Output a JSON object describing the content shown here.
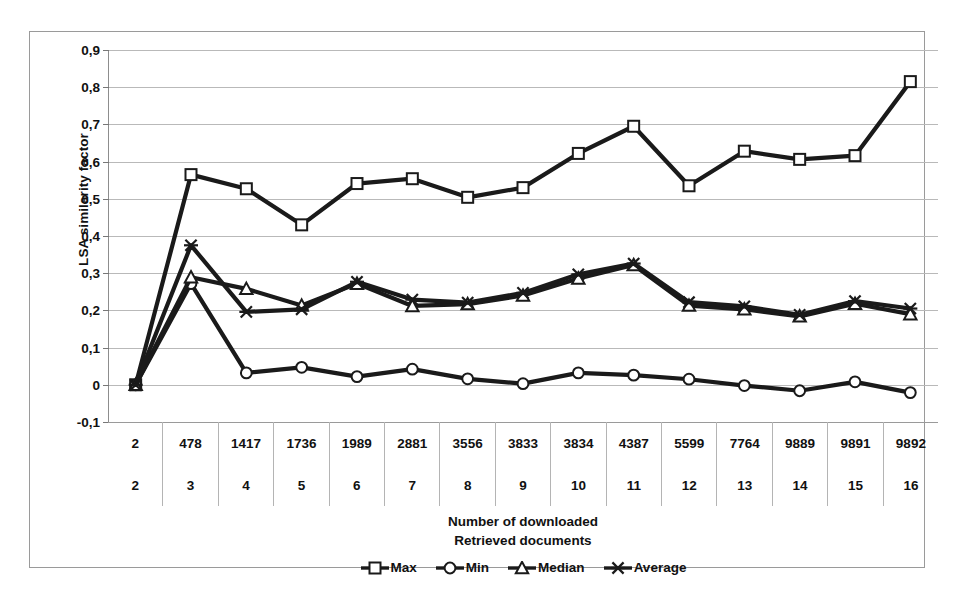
{
  "chart_data": {
    "type": "line",
    "title": "",
    "xlabel": "Number of downloaded\nRetrieved documents",
    "ylabel": "LSA similarity factor",
    "ylim": [
      -0.1,
      0.9
    ],
    "ytick_labels": [
      "0,9",
      "0,8",
      "0,7",
      "0,6",
      "0,5",
      "0,4",
      "0,3",
      "0,2",
      "0,1",
      "0",
      "-0,1"
    ],
    "ytick_values": [
      0.9,
      0.8,
      0.7,
      0.6,
      0.5,
      0.4,
      0.3,
      0.2,
      0.1,
      0,
      -0.1
    ],
    "grid": true,
    "legend_position": "bottom",
    "x_axis_table": {
      "row_top_label": "Number of downloaded",
      "row_bottom_label": "Retrieved documents",
      "row_top": [
        "2",
        "478",
        "1417",
        "1736",
        "1989",
        "2881",
        "3556",
        "3833",
        "3834",
        "4387",
        "5599",
        "7764",
        "9889",
        "9891",
        "9892"
      ],
      "row_bottom": [
        "2",
        "3",
        "4",
        "5",
        "6",
        "7",
        "8",
        "9",
        "10",
        "11",
        "12",
        "13",
        "14",
        "15",
        "16"
      ]
    },
    "categories": [
      "2",
      "3",
      "4",
      "5",
      "6",
      "7",
      "8",
      "9",
      "10",
      "11",
      "12",
      "13",
      "14",
      "15",
      "16"
    ],
    "series": [
      {
        "name": "Max",
        "marker": "square",
        "color": "#1a1a1a",
        "values": [
          0.0,
          0.565,
          0.527,
          0.43,
          0.541,
          0.554,
          0.504,
          0.53,
          0.622,
          0.695,
          0.535,
          0.628,
          0.606,
          0.616,
          0.815
        ]
      },
      {
        "name": "Min",
        "marker": "circle",
        "color": "#1a1a1a",
        "values": [
          0.0,
          0.272,
          0.032,
          0.047,
          0.022,
          0.042,
          0.016,
          0.003,
          0.032,
          0.026,
          0.015,
          -0.002,
          -0.016,
          0.008,
          -0.021
        ]
      },
      {
        "name": "Median",
        "marker": "triangle",
        "color": "#1a1a1a",
        "values": [
          0.0,
          0.289,
          0.258,
          0.213,
          0.272,
          0.212,
          0.217,
          0.24,
          0.286,
          0.322,
          0.213,
          0.203,
          0.184,
          0.218,
          0.19
        ]
      },
      {
        "name": "Average",
        "marker": "star",
        "color": "#1a1a1a",
        "values": [
          0.0,
          0.375,
          0.196,
          0.203,
          0.277,
          0.229,
          0.221,
          0.247,
          0.297,
          0.326,
          0.222,
          0.211,
          0.188,
          0.225,
          0.205
        ]
      }
    ]
  },
  "legend": {
    "items": [
      {
        "label": "Max",
        "marker": "square"
      },
      {
        "label": "Min",
        "marker": "circle"
      },
      {
        "label": "Median",
        "marker": "triangle"
      },
      {
        "label": "Average",
        "marker": "star"
      }
    ]
  },
  "axis_titles": {
    "y": "LSA similarity factor",
    "x_line1": "Number of downloaded",
    "x_line2": "Retrieved documents"
  }
}
